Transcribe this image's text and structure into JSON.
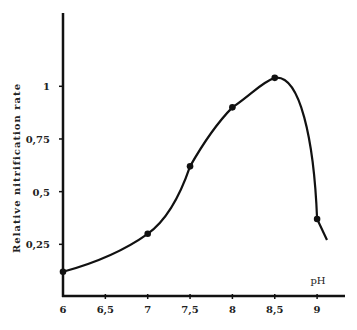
{
  "chart_data": {
    "type": "line",
    "title": "",
    "xlabel": "pH",
    "ylabel": "Relative   nitrification   rate",
    "x_ticks": [
      6,
      6.5,
      7,
      7.5,
      8,
      8.5,
      9
    ],
    "x_tick_labels": [
      "6",
      "6,5",
      "7",
      "7,5",
      "8",
      "8,5",
      "9"
    ],
    "y_ticks": [
      0.25,
      0.5,
      0.75,
      1
    ],
    "y_tick_labels": [
      "0,25",
      "0,5",
      "0,75",
      "1"
    ],
    "xlim": [
      6,
      9.2
    ],
    "ylim": [
      0,
      1.4
    ],
    "grid": false,
    "series": [
      {
        "name": "Relative nitrification rate",
        "x": [
          6,
          7,
          7.5,
          8,
          8.5,
          9
        ],
        "values": [
          0.12,
          0.3,
          0.62,
          0.9,
          1.04,
          0.37
        ]
      }
    ]
  }
}
